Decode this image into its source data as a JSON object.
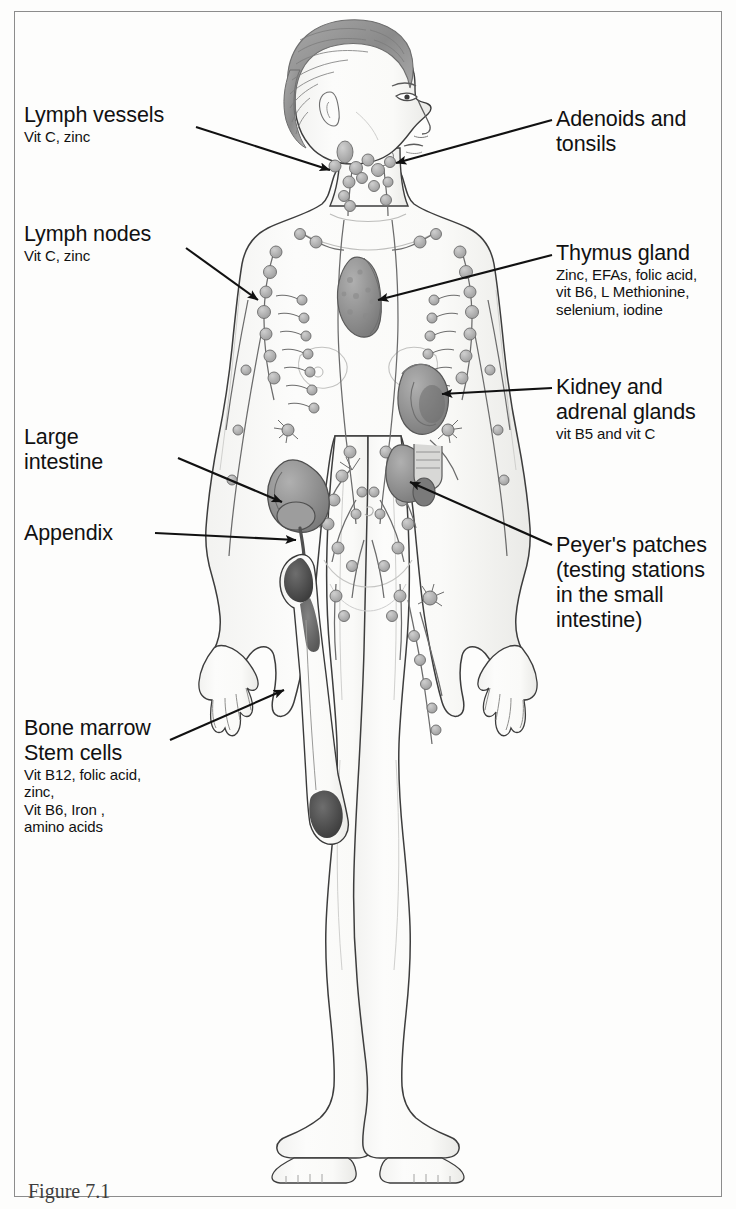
{
  "figure": {
    "caption": "Figure 7.1"
  },
  "labels": {
    "lymph_vessels": {
      "title": "Lymph vessels",
      "sub": [
        "Vit C, zinc"
      ]
    },
    "lymph_nodes": {
      "title": "Lymph nodes",
      "sub": [
        "Vit C, zinc"
      ]
    },
    "large_intestine": {
      "title_line1": "Large",
      "title_line2": "intestine",
      "sub": []
    },
    "appendix": {
      "title": "Appendix",
      "sub": []
    },
    "bone_marrow": {
      "title_line1": "Bone marrow",
      "title_line2": "Stem cells",
      "sub": [
        "Vit B12, folic acid,",
        "zinc,",
        "Vit B6, Iron ,",
        "amino acids"
      ]
    },
    "adenoids_tonsils": {
      "title_line1": "Adenoids and",
      "title_line2": "tonsils",
      "sub": []
    },
    "thymus_gland": {
      "title": "Thymus gland",
      "sub": [
        "Zinc, EFAs, folic acid,",
        "vit B6, L Methionine,",
        "selenium, iodine"
      ]
    },
    "kidney_adrenal": {
      "title_line1": "Kidney and",
      "title_line2": "adrenal glands",
      "sub": [
        "vit B5 and vit C"
      ]
    },
    "peyers_patches": {
      "title": "Peyer's patches",
      "sub": [
        "(testing stations",
        "in the small",
        "intestine)"
      ]
    }
  },
  "colors": {
    "text": "#111111",
    "leader_line": "#1a1a1a",
    "frame": "#8c8c8c",
    "skin_outline": "#3a3a3a",
    "skin_fill": "#fbfbfa",
    "organ_fill": "#9a9a9a",
    "organ_dark": "#5f5f5f",
    "node_fill": "#b4b4b4",
    "hair_fill": "#8e8e8e",
    "marrow_dark": "#4a4a4a"
  }
}
